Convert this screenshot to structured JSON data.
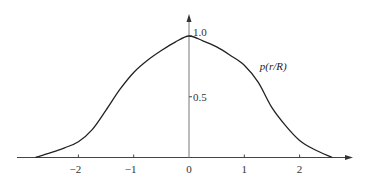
{
  "chart_data": {
    "type": "line",
    "title": "",
    "xlabel": "",
    "ylabel": "",
    "xlim": [
      -3.1,
      2.95
    ],
    "ylim": [
      0,
      1.13
    ],
    "grid": false,
    "legend": "none",
    "x_ticks": [
      -2,
      -1,
      0,
      1,
      2
    ],
    "x_tick_labels": [
      "−2",
      "−1",
      "0",
      "1",
      "2"
    ],
    "y_ticks": [
      0.5,
      1.0
    ],
    "y_tick_labels": [
      "0.5",
      "1.0"
    ],
    "annotations": [
      {
        "text": "p(r/R)",
        "x": 1.28,
        "y": 0.72
      }
    ],
    "series": [
      {
        "name": "p(r/R)",
        "color": "#222222",
        "x": [
          -2.78,
          -2.5,
          -2.25,
          -2.0,
          -1.75,
          -1.5,
          -1.25,
          -1.0,
          -0.75,
          -0.5,
          -0.25,
          0.0,
          0.25,
          0.5,
          0.75,
          1.0,
          1.25,
          1.5,
          1.75,
          2.0,
          2.25,
          2.59
        ],
        "values": [
          0.0,
          0.04,
          0.08,
          0.13,
          0.23,
          0.39,
          0.56,
          0.7,
          0.8,
          0.88,
          0.95,
          1.0,
          0.96,
          0.91,
          0.84,
          0.76,
          0.62,
          0.41,
          0.26,
          0.14,
          0.07,
          0.0
        ]
      }
    ]
  }
}
